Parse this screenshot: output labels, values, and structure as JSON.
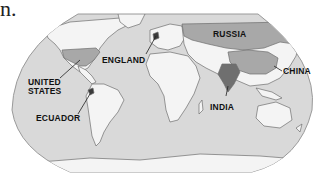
{
  "fragment_text": "n.",
  "map": {
    "projection": "world map (oval)",
    "colors": {
      "ocean": "#d9d9d9",
      "land": "#f4f4f4",
      "coast": "#6e6e6e",
      "highlight": "#a8a8a8",
      "india": "#6f6f6f",
      "marker": "#3a3a3a"
    },
    "labels": [
      {
        "id": "united-states",
        "text_line1": "UNITED",
        "text_line2": "STATES"
      },
      {
        "id": "england",
        "text": "ENGLAND"
      },
      {
        "id": "russia",
        "text": "RUSSIA"
      },
      {
        "id": "china",
        "text": "CHINA"
      },
      {
        "id": "india",
        "text": "INDIA"
      },
      {
        "id": "ecuador",
        "text": "ECUADOR"
      }
    ]
  }
}
